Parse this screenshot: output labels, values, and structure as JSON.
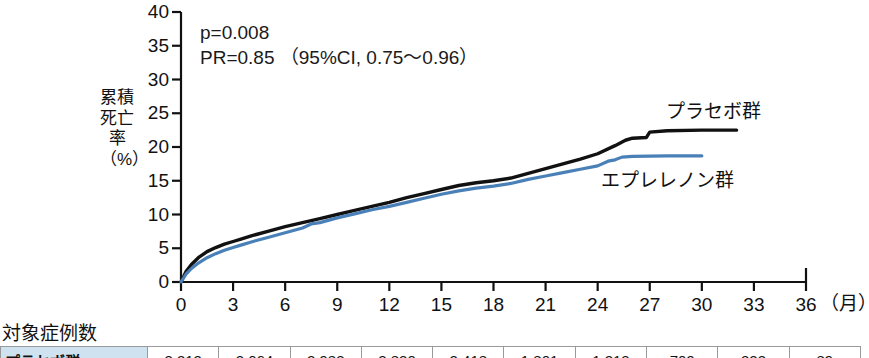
{
  "chart_data": {
    "type": "line",
    "title": "",
    "subtitle": "",
    "xlabel": "(月)",
    "ylabel": "累積死亡率(%)",
    "xlim": [
      0,
      36
    ],
    "ylim": [
      0,
      40
    ],
    "xticks": [
      0,
      3,
      6,
      9,
      12,
      15,
      18,
      21,
      24,
      27,
      30,
      33,
      36
    ],
    "yticks": [
      0,
      5,
      10,
      15,
      20,
      25,
      30,
      35,
      40
    ],
    "grid": false,
    "legend_position": "inline-right",
    "annotations": [
      "p=0.008",
      "PR=0.85 (95%CI, 0.75~0.96)"
    ],
    "series": [
      {
        "name": "プラセボ群",
        "color": "#111111",
        "x": [
          0,
          0.3,
          0.6,
          1,
          1.5,
          2,
          2.5,
          3,
          3.5,
          4,
          5,
          6,
          7,
          8,
          9,
          10,
          11,
          12,
          13,
          14,
          15,
          16,
          17,
          18,
          19,
          20,
          21,
          22,
          23,
          24,
          25,
          25.6,
          26,
          26.8,
          27,
          28,
          30,
          32
        ],
        "y": [
          0,
          1.6,
          2.6,
          3.6,
          4.5,
          5.1,
          5.6,
          6.0,
          6.4,
          6.8,
          7.5,
          8.2,
          8.8,
          9.4,
          10.0,
          10.6,
          11.2,
          11.8,
          12.5,
          13.1,
          13.7,
          14.3,
          14.7,
          15.0,
          15.4,
          16.1,
          16.8,
          17.5,
          18.2,
          19.0,
          20.2,
          21.0,
          21.3,
          21.4,
          22.2,
          22.4,
          22.5,
          22.5
        ]
      },
      {
        "name": "エプレレノン群",
        "color": "#4a80b8",
        "x": [
          0,
          0.3,
          0.6,
          1,
          1.5,
          2,
          2.5,
          3,
          3.5,
          4,
          5,
          6,
          7,
          7.5,
          8,
          9,
          10,
          11,
          12,
          13,
          14,
          15,
          16,
          17,
          18,
          19,
          20,
          21,
          22,
          23,
          24,
          24.6,
          25,
          25.4,
          26,
          28,
          30
        ],
        "y": [
          0,
          1.2,
          2.0,
          2.8,
          3.6,
          4.2,
          4.7,
          5.1,
          5.5,
          5.9,
          6.6,
          7.3,
          8.0,
          8.6,
          8.8,
          9.5,
          10.1,
          10.7,
          11.2,
          11.8,
          12.4,
          13.0,
          13.5,
          13.9,
          14.2,
          14.6,
          15.2,
          15.7,
          16.2,
          16.7,
          17.2,
          17.9,
          18.1,
          18.5,
          18.6,
          18.7,
          18.7
        ]
      }
    ]
  },
  "annotation": {
    "line1": "p=0.008",
    "line2": "PR=0.85 （95%CI, 0.75～0.96）"
  },
  "axis": {
    "y_label": "累積\n死亡\n率\n（%）",
    "y_label_lines": [
      "累",
      "積",
      "死",
      "亡",
      "率",
      "（%）"
    ],
    "x_unit": "（月）"
  },
  "series_labels": {
    "placebo": "プラセボ群",
    "eplerenone": "エプレレノン群"
  },
  "table": {
    "caption": "対象症例数",
    "rows": [
      {
        "label": "プラセボ群",
        "values": [
          "3,313",
          "3,064",
          "2,983",
          "2,830",
          "2,418",
          "1,801",
          "1,213",
          "709",
          "323",
          "89"
        ]
      }
    ]
  }
}
